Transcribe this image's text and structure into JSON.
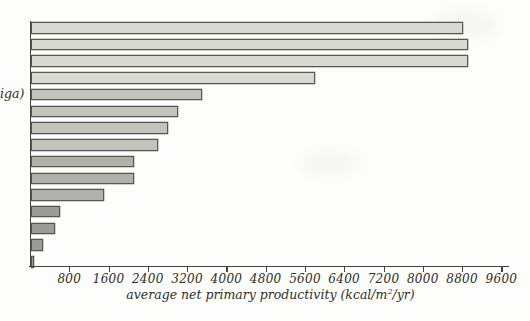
{
  "figure": {
    "partial_y_label": "iga)",
    "xaxis": {
      "tick_labels": [
        "800",
        "1600",
        "2400",
        "3200",
        "4000",
        "4800",
        "5600",
        "6400",
        "7200",
        "8000",
        "8800",
        "9600"
      ],
      "title_prefix": "average net primary productivity (kcal/m",
      "title_sup": "2",
      "title_suffix": "/yr)"
    }
  },
  "chart_data": {
    "type": "bar",
    "orientation": "horizontal",
    "title": "",
    "xlabel": "average net primary productivity (kcal/m2/yr)",
    "x_ticks": [
      800,
      1600,
      2400,
      3200,
      4000,
      4800,
      5600,
      6400,
      7200,
      8000,
      8800,
      9600
    ],
    "xlim": [
      0,
      9600
    ],
    "grid": false,
    "legend": false,
    "categories_visible": [
      "",
      "",
      "",
      "",
      "iga)",
      "",
      "",
      "",
      "",
      "",
      "",
      "",
      "",
      "",
      ""
    ],
    "values": [
      8800,
      8900,
      8900,
      5800,
      3500,
      3000,
      2800,
      2600,
      2100,
      2100,
      1500,
      600,
      500,
      250,
      70
    ],
    "bar_color_groups": [
      0,
      0,
      0,
      0,
      1,
      1,
      1,
      1,
      2,
      2,
      2,
      3,
      3,
      3,
      3
    ],
    "palette": [
      "#d9dad3",
      "#c2c4bc",
      "#b0b2aa",
      "#9b9d95"
    ],
    "bar_border_color": "#57574f",
    "axis_color": "#44443e",
    "text_color": "#2e2e29"
  }
}
